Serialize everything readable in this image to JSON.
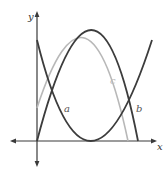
{
  "diagram": {
    "type": "function-graph",
    "axes": {
      "x_label": "x",
      "y_label": "y"
    },
    "curves": [
      {
        "id": "a",
        "label": "a",
        "shape": "upward parabola",
        "color": "#3c3c3c"
      },
      {
        "id": "b",
        "label": "b",
        "shape": "downward parabola through origin",
        "color": "#3c3c3c"
      },
      {
        "id": "c",
        "label": "c",
        "shape": "downward parabola",
        "color": "#b8b8b8"
      }
    ],
    "colors": {
      "axis": "#3a3a3a",
      "dark_curve": "#3c3c3c",
      "light_curve": "#b8b8b8",
      "background": "#ffffff"
    }
  }
}
